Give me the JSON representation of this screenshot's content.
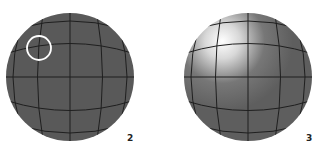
{
  "figure": {
    "panels": [
      {
        "label": "2",
        "description": "Gray sphere with grid lines; a white circle marks a grid intersection (selected vertex)",
        "fill_color": "#595959",
        "grid_color": "#1f1f1f",
        "highlight_ring_color": "#ffffff",
        "specular": false
      },
      {
        "label": "3",
        "description": "Same grid sphere with a bright specular highlight in the upper-left",
        "fill_color": "#606060",
        "grid_color": "#1f1f1f",
        "highlight_color": "#ffffff",
        "specular": true
      }
    ]
  }
}
